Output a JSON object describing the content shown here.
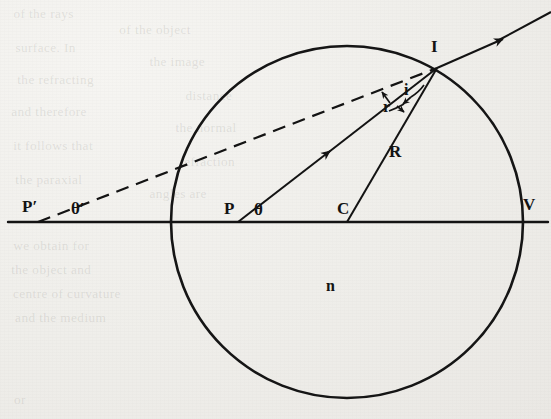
{
  "figure": {
    "type": "optics-ray-diagram",
    "background_color": "#efeeea",
    "ink_color": "#131313"
  },
  "labels": [
    {
      "id": "p-prime",
      "text": "P′",
      "x": 22,
      "y": 198,
      "size": 17,
      "italic": false
    },
    {
      "id": "theta-prime",
      "text": "θ′",
      "x": 71,
      "y": 200,
      "size": 17,
      "italic": false
    },
    {
      "id": "p",
      "text": "P",
      "x": 224,
      "y": 200,
      "size": 17,
      "italic": false
    },
    {
      "id": "theta",
      "text": "θ",
      "x": 254,
      "y": 201,
      "size": 17,
      "italic": false
    },
    {
      "id": "c",
      "text": "C",
      "x": 337,
      "y": 200,
      "size": 17,
      "italic": false
    },
    {
      "id": "v",
      "text": "V",
      "x": 523,
      "y": 196,
      "size": 17,
      "italic": false
    },
    {
      "id": "i-point",
      "text": "I",
      "x": 431,
      "y": 38,
      "size": 17,
      "italic": false
    },
    {
      "id": "angle-i",
      "text": "i",
      "x": 404,
      "y": 82,
      "size": 16,
      "italic": false
    },
    {
      "id": "angle-r",
      "text": "r",
      "x": 383,
      "y": 99,
      "size": 16,
      "italic": false
    },
    {
      "id": "radius-R",
      "text": "R",
      "x": 389,
      "y": 143,
      "size": 17,
      "italic": false
    },
    {
      "id": "index-n",
      "text": "n",
      "x": 326,
      "y": 278,
      "size": 16,
      "italic": false
    }
  ],
  "geometry": {
    "circle": {
      "cx": 347,
      "cy": 222,
      "r": 176
    },
    "axis": {
      "x1": 8,
      "y1": 222,
      "x2": 548,
      "y2": 222
    },
    "point_I": {
      "x": 437,
      "y": 68
    },
    "point_P": {
      "x": 238,
      "y": 222
    },
    "point_C": {
      "x": 347,
      "y": 222
    },
    "point_P_prime": {
      "x": 38,
      "y": 222
    },
    "point_V": {
      "x": 523,
      "y": 222
    }
  },
  "ghost_text": [
    {
      "text": "of the rays",
      "x": 14,
      "y": 6,
      "size": 13
    },
    {
      "text": "of the object",
      "x": 120,
      "y": 22,
      "size": 13
    },
    {
      "text": "surface. In",
      "x": 16,
      "y": 40,
      "size": 13
    },
    {
      "text": "the image",
      "x": 150,
      "y": 54,
      "size": 13
    },
    {
      "text": "the refracting",
      "x": 18,
      "y": 72,
      "size": 13
    },
    {
      "text": "distance",
      "x": 186,
      "y": 88,
      "size": 13
    },
    {
      "text": "and therefore",
      "x": 12,
      "y": 104,
      "size": 13
    },
    {
      "text": "the normal",
      "x": 176,
      "y": 120,
      "size": 13
    },
    {
      "text": "it follows that",
      "x": 14,
      "y": 138,
      "size": 13
    },
    {
      "text": "refraction",
      "x": 180,
      "y": 154,
      "size": 13
    },
    {
      "text": "the paraxial",
      "x": 16,
      "y": 172,
      "size": 13
    },
    {
      "text": "angles are",
      "x": 150,
      "y": 186,
      "size": 13
    },
    {
      "text": "we obtain for",
      "x": 14,
      "y": 238,
      "size": 13
    },
    {
      "text": "the object and",
      "x": 12,
      "y": 262,
      "size": 13
    },
    {
      "text": "centre of curvature",
      "x": 14,
      "y": 286,
      "size": 13
    },
    {
      "text": "and the medium",
      "x": 16,
      "y": 310,
      "size": 13
    },
    {
      "text": "or",
      "x": 14,
      "y": 392,
      "size": 13
    }
  ]
}
